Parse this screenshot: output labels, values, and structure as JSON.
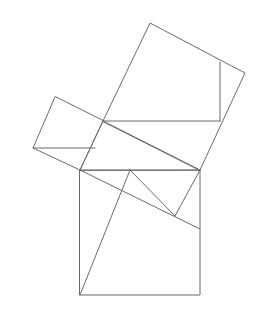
{
  "figure": {
    "canvas": {
      "width": 261,
      "height": 314
    },
    "background_color": "#ffffff",
    "stroke_color": "#6b6b6b",
    "stroke_width": 1
  },
  "chart_data": {
    "type": "diagram",
    "shapes": [
      {
        "name": "right-triangle",
        "role": "central right triangle",
        "points": [
          [
            80,
            170
          ],
          [
            103,
            121
          ],
          [
            200,
            170
          ]
        ],
        "right_angle_at": [
          103,
          121
        ]
      },
      {
        "name": "square-on-hypotenuse",
        "role": "large square on the bottom side",
        "points": [
          [
            80,
            170
          ],
          [
            200,
            170
          ],
          [
            200,
            295
          ],
          [
            80,
            295
          ]
        ]
      },
      {
        "name": "square-on-long-leg",
        "role": "tilted square on the upper-right leg",
        "points": [
          [
            103,
            121
          ],
          [
            150,
            23
          ],
          [
            245,
            73
          ],
          [
            200,
            170
          ]
        ]
      },
      {
        "name": "square-on-short-leg",
        "role": "small tilted square on the upper-left leg",
        "points": [
          [
            103,
            121
          ],
          [
            80,
            170
          ],
          [
            33,
            148
          ],
          [
            55,
            97
          ]
        ]
      }
    ],
    "internal_lines": [
      {
        "name": "vertical-chord-upper-square",
        "from": [
          220,
          62
        ],
        "to": [
          220,
          121
        ]
      },
      {
        "name": "horizontal-chord-left",
        "from": [
          33,
          148
        ],
        "to": [
          95,
          148
        ]
      },
      {
        "name": "horizontal-chord-upper",
        "from": [
          103,
          121
        ],
        "to": [
          220,
          121
        ]
      },
      {
        "name": "diagonal-bottom-left",
        "from": [
          80,
          295
        ],
        "to": [
          130,
          170
        ]
      },
      {
        "name": "diagonal-to-right-edge",
        "from": [
          80,
          170
        ],
        "to": [
          200,
          229
        ]
      },
      {
        "name": "short-connector",
        "from": [
          130,
          170
        ],
        "to": [
          175,
          216
        ]
      },
      {
        "name": "connector-to-corner",
        "from": [
          175,
          216
        ],
        "to": [
          200,
          170
        ]
      }
    ],
    "vertices": {
      "triangle_left": [
        80,
        170
      ],
      "triangle_apex": [
        103,
        121
      ],
      "triangle_right": [
        200,
        170
      ],
      "bottom_square_bl": [
        80,
        295
      ],
      "bottom_square_br": [
        200,
        295
      ],
      "upper_square_top": [
        150,
        23
      ],
      "upper_square_right": [
        245,
        73
      ],
      "left_square_top": [
        55,
        97
      ],
      "left_square_left": [
        33,
        148
      ]
    },
    "xlabel": "",
    "ylabel": "",
    "grid": false,
    "legend": null
  }
}
